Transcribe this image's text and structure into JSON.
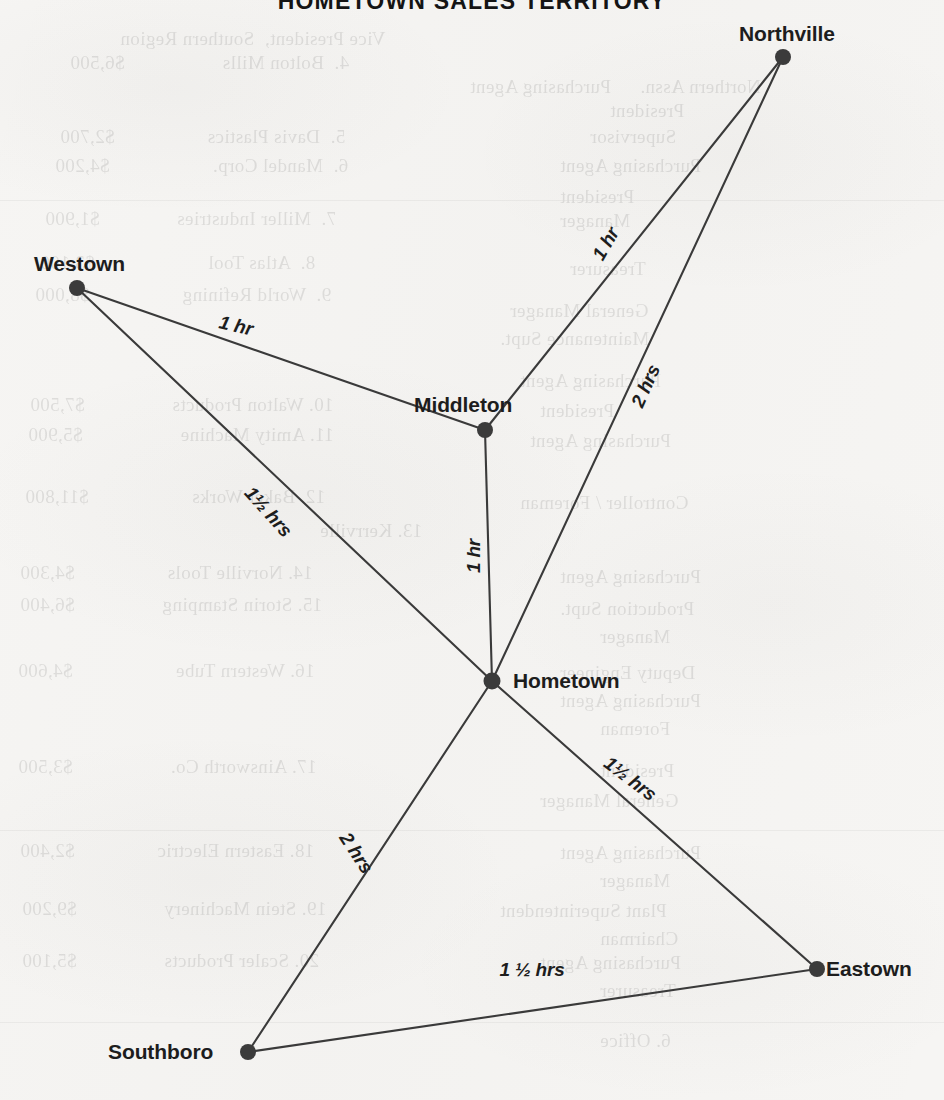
{
  "page": {
    "title_partial": "HOMETOWN SALES TERRITORY",
    "paper_color": "#f6f5f3",
    "ink_color": "#3a3a3a"
  },
  "diagram": {
    "type": "network-map",
    "nodes": [
      {
        "id": "northville",
        "label": "Northville",
        "x": 783,
        "y": 57,
        "label_x": 739,
        "label_y": 22,
        "label_align": "above-left"
      },
      {
        "id": "westown",
        "label": "Westown",
        "x": 77,
        "y": 288,
        "label_x": 34,
        "label_y": 252,
        "label_align": "above-right"
      },
      {
        "id": "middleton",
        "label": "Middleton",
        "x": 485,
        "y": 430,
        "label_x": 414,
        "label_y": 393,
        "label_align": "above-left"
      },
      {
        "id": "hometown",
        "label": "Hometown",
        "x": 492,
        "y": 681,
        "label_x": 513,
        "label_y": 669,
        "label_align": "right"
      },
      {
        "id": "eastown",
        "label": "Eastown",
        "x": 817,
        "y": 969,
        "label_x": 826,
        "label_y": 957,
        "label_align": "right"
      },
      {
        "id": "southboro",
        "label": "Southboro",
        "x": 248,
        "y": 1052,
        "label_x": 108,
        "label_y": 1040,
        "label_align": "left"
      }
    ],
    "edges": [
      {
        "from": "westown",
        "to": "middleton",
        "label": "1 hr",
        "label_x": 236,
        "label_y": 326,
        "rotation": 13
      },
      {
        "from": "westown",
        "to": "hometown",
        "label": "1½ hrs",
        "label_x": 268,
        "label_y": 512,
        "rotation": 48
      },
      {
        "from": "middleton",
        "to": "northville",
        "label": "1 hr",
        "label_x": 606,
        "label_y": 244,
        "rotation": -60
      },
      {
        "from": "middleton",
        "to": "hometown",
        "label": "1 hr",
        "label_x": 474,
        "label_y": 556,
        "rotation": -90
      },
      {
        "from": "hometown",
        "to": "northville",
        "label": "2 hrs",
        "label_x": 646,
        "label_y": 386,
        "rotation": -66
      },
      {
        "from": "hometown",
        "to": "eastown",
        "label": "1½ hrs",
        "label_x": 630,
        "label_y": 779,
        "rotation": 37
      },
      {
        "from": "hometown",
        "to": "southboro",
        "label": "2 hrs",
        "label_x": 356,
        "label_y": 853,
        "rotation": 57
      },
      {
        "from": "southboro",
        "to": "eastown",
        "label": "1 ½ hrs",
        "label_x": 532,
        "label_y": 970,
        "rotation": 0
      }
    ]
  },
  "bleed_through": {
    "note": "Faint mirror-reversed show-through of a numbered list from the reverse side of the page",
    "lines": [
      {
        "text": "Vice President,  Southern Region",
        "x": 120,
        "y": 28,
        "size": 19
      },
      {
        "text": "4.  Bolton Mills                   $6,500",
        "x": 70,
        "y": 52,
        "size": 19
      },
      {
        "text": "Purchasing Agent",
        "x": 470,
        "y": 76,
        "size": 19
      },
      {
        "text": "Northern Assn.",
        "x": 640,
        "y": 76,
        "size": 19
      },
      {
        "text": "President",
        "x": 610,
        "y": 100,
        "size": 19
      },
      {
        "text": "5.  Davis Plastics                  $2,700",
        "x": 60,
        "y": 126,
        "size": 19
      },
      {
        "text": "Supervisor",
        "x": 590,
        "y": 126,
        "size": 19
      },
      {
        "text": "6.  Mandel Corp.                    $4,200",
        "x": 55,
        "y": 155,
        "size": 19
      },
      {
        "text": "Purchasing Agent",
        "x": 560,
        "y": 155,
        "size": 19
      },
      {
        "text": "President",
        "x": 560,
        "y": 186,
        "size": 19
      },
      {
        "text": "7.  Miller Industries               $1,900",
        "x": 45,
        "y": 208,
        "size": 19
      },
      {
        "text": "Manager",
        "x": 560,
        "y": 210,
        "size": 19
      },
      {
        "text": "8.  Atlas Tool                      $3,100",
        "x": 40,
        "y": 252,
        "size": 19
      },
      {
        "text": "Treasurer",
        "x": 570,
        "y": 258,
        "size": 19
      },
      {
        "text": "9.  World Refining                  $8,000",
        "x": 35,
        "y": 284,
        "size": 19
      },
      {
        "text": "General Manager",
        "x": 510,
        "y": 300,
        "size": 19
      },
      {
        "text": "Maintenance Supt.",
        "x": 500,
        "y": 328,
        "size": 19
      },
      {
        "text": "Purchasing Agent",
        "x": 520,
        "y": 370,
        "size": 19
      },
      {
        "text": "10. Walton Products                 $7,500",
        "x": 30,
        "y": 394,
        "size": 19
      },
      {
        "text": "President",
        "x": 540,
        "y": 400,
        "size": 19
      },
      {
        "text": "11. Amity Machine                   $5,900",
        "x": 28,
        "y": 424,
        "size": 19
      },
      {
        "text": "Purchasing Agent",
        "x": 530,
        "y": 430,
        "size": 19
      },
      {
        "text": "12. Baker Works                    $11,800",
        "x": 25,
        "y": 486,
        "size": 19
      },
      {
        "text": "Controller / Foreman",
        "x": 520,
        "y": 492,
        "size": 19
      },
      {
        "text": "13. Kerrville",
        "x": 320,
        "y": 520,
        "size": 19
      },
      {
        "text": "14. Norville Tools                  $4,300",
        "x": 20,
        "y": 562,
        "size": 19
      },
      {
        "text": "Purchasing Agent",
        "x": 560,
        "y": 566,
        "size": 19
      },
      {
        "text": "15. Storin Stamping                 $6,400",
        "x": 20,
        "y": 594,
        "size": 19
      },
      {
        "text": "Production Supt.",
        "x": 560,
        "y": 598,
        "size": 19
      },
      {
        "text": "Manager",
        "x": 600,
        "y": 626,
        "size": 19
      },
      {
        "text": "16. Western Tube                    $4,600",
        "x": 18,
        "y": 660,
        "size": 19
      },
      {
        "text": "Deputy Engineer",
        "x": 560,
        "y": 662,
        "size": 19
      },
      {
        "text": "Purchasing Agent",
        "x": 560,
        "y": 690,
        "size": 19
      },
      {
        "text": "Foreman",
        "x": 600,
        "y": 718,
        "size": 19
      },
      {
        "text": "17. Ainsworth Co.                   $3,500",
        "x": 18,
        "y": 756,
        "size": 19
      },
      {
        "text": "President",
        "x": 600,
        "y": 760,
        "size": 19
      },
      {
        "text": "General Manager",
        "x": 540,
        "y": 790,
        "size": 19
      },
      {
        "text": "18. Eastern Electric                $2,400",
        "x": 20,
        "y": 840,
        "size": 19
      },
      {
        "text": "Purchasing Agent",
        "x": 560,
        "y": 842,
        "size": 19
      },
      {
        "text": "Manager",
        "x": 600,
        "y": 870,
        "size": 19
      },
      {
        "text": "19. Stein Machinery                 $9,200",
        "x": 22,
        "y": 898,
        "size": 19
      },
      {
        "text": "Plant Superintendent",
        "x": 500,
        "y": 900,
        "size": 19
      },
      {
        "text": "Chairman",
        "x": 600,
        "y": 928,
        "size": 19
      },
      {
        "text": "20. Scaler Products                 $5,100",
        "x": 22,
        "y": 950,
        "size": 19
      },
      {
        "text": "Purchasing Agent",
        "x": 540,
        "y": 952,
        "size": 19
      },
      {
        "text": "Treasurer",
        "x": 600,
        "y": 980,
        "size": 19
      },
      {
        "text": "6. Office",
        "x": 600,
        "y": 1030,
        "size": 19
      }
    ],
    "rules": [
      {
        "x": 0,
        "y": 200,
        "w": 944
      },
      {
        "x": 0,
        "y": 830,
        "w": 944
      },
      {
        "x": 0,
        "y": 1022,
        "w": 944
      }
    ]
  }
}
